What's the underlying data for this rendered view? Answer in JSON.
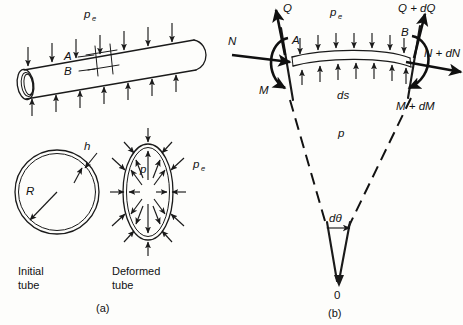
{
  "figure": {
    "title_a": "(a)",
    "title_b": "(b)",
    "panel_a": {
      "pressure_external_label": "p",
      "pressure_external_sub": "e",
      "element_label_top": "A",
      "element_label_bottom": "B",
      "initial_tube_caption_line1": "Initial",
      "initial_tube_caption_line2": "tube",
      "deformed_tube_caption_line1": "Deformed",
      "deformed_tube_caption_line2": "tube",
      "radius_label": "R",
      "thickness_label": "h",
      "internal_pressure_label": "p",
      "external_pressure_label": "p",
      "external_pressure_sub": "e",
      "arrows_top_count": 7,
      "arrows_bottom_count": 7
    },
    "panel_b": {
      "shear_left_label": "Q",
      "shear_right_label": "Q + dQ",
      "normal_left_label": "N",
      "normal_right_label": "N + dN",
      "moment_left_label": "M",
      "moment_right_label": "M + dM",
      "pressure_external_label": "p",
      "pressure_external_sub": "e",
      "pressure_internal_label": "p",
      "arc_length_label": "ds",
      "angle_label": "dθ",
      "center_label": "0",
      "section_label_left": "A",
      "section_label_right": "B",
      "arrows_top_count": 7,
      "arrows_bottom_count": 7
    }
  },
  "colors": {
    "ink": "#111111",
    "paper": "#fdfdfb"
  }
}
